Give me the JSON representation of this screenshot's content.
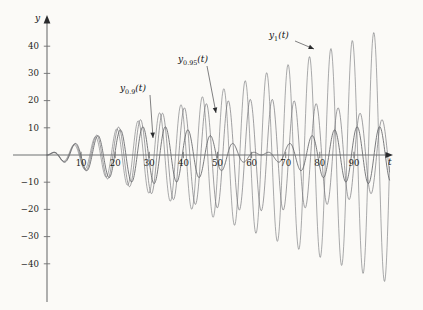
{
  "figure": {
    "background_color": "#fbfaf7",
    "axis_color": "#6f7072"
  },
  "axes": {
    "y_axis_name": "y",
    "x_axis_name": "t",
    "y_ticks": [
      {
        "value": 40,
        "label": "40"
      },
      {
        "value": 30,
        "label": "30"
      },
      {
        "value": 20,
        "label": "20"
      },
      {
        "value": 10,
        "label": "10"
      },
      {
        "value": -10,
        "label": "−10"
      },
      {
        "value": -20,
        "label": "−20"
      },
      {
        "value": -30,
        "label": "−30"
      },
      {
        "value": -40,
        "label": "−40"
      }
    ],
    "x_ticks": [
      {
        "value": 10,
        "label": "10"
      },
      {
        "value": 20,
        "label": "20"
      },
      {
        "value": 30,
        "label": "30"
      },
      {
        "value": 40,
        "label": "40"
      },
      {
        "value": 50,
        "label": "50"
      },
      {
        "value": 60,
        "label": "60"
      },
      {
        "value": 70,
        "label": "70"
      },
      {
        "value": 80,
        "label": "80"
      },
      {
        "value": 90,
        "label": "90"
      }
    ]
  },
  "annotations": [
    {
      "name": "label-y-0-9",
      "text_main": "y",
      "text_sub": "0.9",
      "text_tail": "(t)",
      "label_x": 120,
      "label_y": 84,
      "leader_from_x": 150,
      "leader_from_y": 95,
      "leader_to_x": 153,
      "leader_to_y": 138
    },
    {
      "name": "label-y-0-95",
      "text_main": "y",
      "text_sub": "0.95",
      "text_tail": "(t)",
      "label_x": 178,
      "label_y": 55,
      "leader_from_x": 207,
      "leader_from_y": 66,
      "leader_to_x": 216,
      "leader_to_y": 113
    },
    {
      "name": "label-y-1",
      "text_main": "y",
      "text_sub": "1",
      "text_tail": "(t)",
      "label_x": 269,
      "label_y": 31,
      "leader_from_x": 295,
      "leader_from_y": 41,
      "leader_to_x": 314,
      "leader_to_y": 49
    }
  ],
  "chart_data": {
    "type": "line",
    "title": "",
    "xlabel": "t",
    "ylabel": "y",
    "xlim": [
      0,
      100
    ],
    "ylim": [
      -47,
      47
    ],
    "grid": false,
    "legend_position": "inline-annotations",
    "series": [
      {
        "name": "y_0.9(t)",
        "omega": 0.9,
        "color": "#5d5e62",
        "envelope_type": "beats",
        "envelope_amplitude_max": 10.5,
        "beat_period": 62.8,
        "peak_envelope_at_t": [
          7,
          70
        ],
        "amplitude_at_t": [
          {
            "t": 0,
            "a": 0
          },
          {
            "t": 10,
            "a": 9.8
          },
          {
            "t": 20,
            "a": 8.0
          },
          {
            "t": 30,
            "a": 4.0
          },
          {
            "t": 40,
            "a": 1.0
          },
          {
            "t": 50,
            "a": 4.4
          },
          {
            "t": 60,
            "a": 8.3
          },
          {
            "t": 70,
            "a": 10.4
          },
          {
            "t": 80,
            "a": 9.3
          },
          {
            "t": 90,
            "a": 6.0
          },
          {
            "t": 100,
            "a": 1.8
          }
        ]
      },
      {
        "name": "y_0.95(t)",
        "omega": 0.95,
        "color": "#6f7074",
        "envelope_type": "beats",
        "envelope_amplitude_max": 20.5,
        "beat_period": 125.6,
        "peak_envelope_at_t": [
          63
        ],
        "amplitude_at_t": [
          {
            "t": 0,
            "a": 0
          },
          {
            "t": 10,
            "a": 5.0
          },
          {
            "t": 20,
            "a": 9.7
          },
          {
            "t": 30,
            "a": 13.9
          },
          {
            "t": 40,
            "a": 17.2
          },
          {
            "t": 50,
            "a": 19.4
          },
          {
            "t": 60,
            "a": 20.4
          },
          {
            "t": 70,
            "a": 20.1
          },
          {
            "t": 80,
            "a": 18.5
          },
          {
            "t": 90,
            "a": 15.7
          },
          {
            "t": 100,
            "a": 12.0
          }
        ]
      },
      {
        "name": "y_1(t)",
        "omega": 1,
        "color": "#75767a",
        "envelope_type": "linear-resonance",
        "envelope_slope": 0.47,
        "amplitude_at_t": [
          {
            "t": 0,
            "a": 0
          },
          {
            "t": 10,
            "a": 5.0
          },
          {
            "t": 20,
            "a": 10.0
          },
          {
            "t": 30,
            "a": 14.5
          },
          {
            "t": 40,
            "a": 19.0
          },
          {
            "t": 50,
            "a": 24.0
          },
          {
            "t": 60,
            "a": 28.5
          },
          {
            "t": 70,
            "a": 33.0
          },
          {
            "t": 80,
            "a": 38.0
          },
          {
            "t": 90,
            "a": 42.5
          },
          {
            "t": 100,
            "a": 47.0
          }
        ]
      }
    ]
  }
}
